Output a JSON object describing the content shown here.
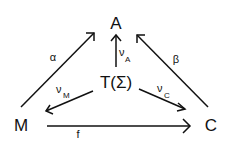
{
  "diagram": {
    "type": "commutative-diagram",
    "nodes": {
      "A": "A",
      "T": "T(Σ)",
      "M": "M",
      "C": "C"
    },
    "edges": {
      "alpha": {
        "label": "α",
        "from": "M",
        "to": "A"
      },
      "beta": {
        "label": "β",
        "from": "C",
        "to": "A"
      },
      "nuA": {
        "label": "ν",
        "sub": "A",
        "from": "T(Σ)",
        "to": "A"
      },
      "nuM": {
        "label": "ν",
        "sub": "M",
        "from": "T(Σ)",
        "to": "M"
      },
      "nuC": {
        "label": "ν",
        "sub": "C",
        "from": "T(Σ)",
        "to": "C"
      },
      "f": {
        "label": "f",
        "from": "M",
        "to": "C"
      }
    },
    "colors": {
      "ink": "#111111",
      "background": "#ffffff"
    }
  }
}
